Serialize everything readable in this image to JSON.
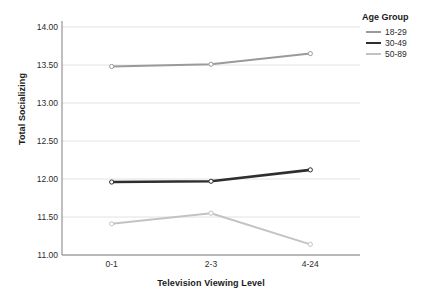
{
  "chart_data": {
    "type": "line",
    "title": "",
    "xlabel": "Television Viewing Level",
    "ylabel": "Total Socializing",
    "categories": [
      "0-1",
      "2-3",
      "4-24"
    ],
    "ylim": [
      11.0,
      14.0
    ],
    "yticks": [
      "11.00",
      "11.50",
      "12.00",
      "12.50",
      "13.00",
      "13.50",
      "14.00"
    ],
    "ytick_values": [
      11.0,
      11.5,
      12.0,
      12.5,
      13.0,
      13.5,
      14.0
    ],
    "grid": "horizontal",
    "legend_position": "top-right",
    "legend_title": "Age Group",
    "series": [
      {
        "name": "18-29",
        "values": [
          13.48,
          13.51,
          13.65
        ],
        "color": "#9a9a9a",
        "width": 2.0
      },
      {
        "name": "30-49",
        "values": [
          11.96,
          11.97,
          12.12
        ],
        "color": "#2e2e2e",
        "width": 2.6
      },
      {
        "name": "50-89",
        "values": [
          11.41,
          11.55,
          11.14
        ],
        "color": "#c3c3c3",
        "width": 2.0
      }
    ],
    "marker": "open-circle",
    "axis_color": "#808080",
    "grid_color": "#e2e2e2",
    "background": "#ffffff"
  }
}
